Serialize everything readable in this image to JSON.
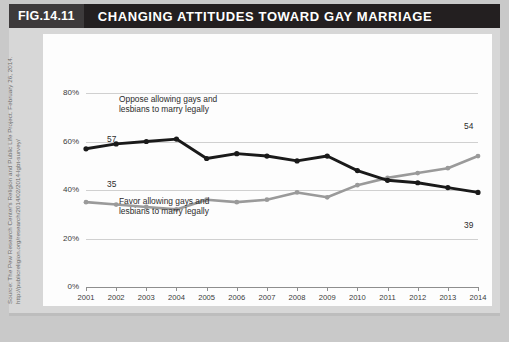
{
  "header": {
    "figure_number": "FIG.14.11",
    "title": "CHANGING ATTITUDES TOWARD GAY MARRIAGE"
  },
  "source": {
    "line1": "Source: The Pew Research Center's Religion and Public Life Project. February 26, 2014.",
    "line2": "http://publicreligion.org/research/2014/02/2014-lgbt-survey/"
  },
  "annotations": {
    "oppose_line1": "Oppose allowing gays and",
    "oppose_line2": "lesbians to marry legally",
    "favor_line1": "Favor allowing gays and",
    "favor_line2": "lesbians to marry legally",
    "oppose_start_value": "57",
    "oppose_end_value": "39",
    "favor_start_value": "35",
    "favor_end_value": "54"
  },
  "colors": {
    "oppose": "#1a1a1a",
    "favor": "#9a9a9a",
    "header_bar": "#231f20",
    "fignum_box": "#3d3a3b",
    "page_bg": "#c9c9c9",
    "band_bg": "#d7d7d7",
    "panel_bg": "#fdfdfd",
    "gridline": "#d0d0d0",
    "axis": "#8e8e8e"
  },
  "chart_data": {
    "type": "line",
    "title": "CHANGING ATTITUDES TOWARD GAY MARRIAGE",
    "xlabel": "",
    "ylabel": "",
    "x": [
      2001,
      2002,
      2003,
      2004,
      2005,
      2006,
      2007,
      2008,
      2009,
      2010,
      2011,
      2012,
      2013,
      2014
    ],
    "categories": [
      "2001",
      "2002",
      "2003",
      "2004",
      "2005",
      "2006",
      "2007",
      "2008",
      "2009",
      "2010",
      "2011",
      "2012",
      "2013",
      "2014"
    ],
    "ylim": [
      0,
      80
    ],
    "yticks": [
      0,
      20,
      40,
      60,
      80
    ],
    "ytick_labels": [
      "0%",
      "20%",
      "40%",
      "60%",
      "80%"
    ],
    "grid": true,
    "legend": "inline-annotations",
    "series": [
      {
        "name": "Oppose allowing gays and lesbians to marry legally",
        "color": "#1a1a1a",
        "values": [
          57,
          59,
          60,
          61,
          53,
          55,
          54,
          52,
          54,
          48,
          44,
          43,
          41,
          39
        ],
        "labeled_points": {
          "2001": 57,
          "2014": 39
        }
      },
      {
        "name": "Favor allowing gays and lesbians to marry legally",
        "color": "#9a9a9a",
        "values": [
          35,
          34,
          33,
          32,
          36,
          35,
          36,
          39,
          37,
          42,
          45,
          47,
          49,
          54
        ],
        "labeled_points": {
          "2001": 35,
          "2014": 54
        }
      }
    ]
  }
}
